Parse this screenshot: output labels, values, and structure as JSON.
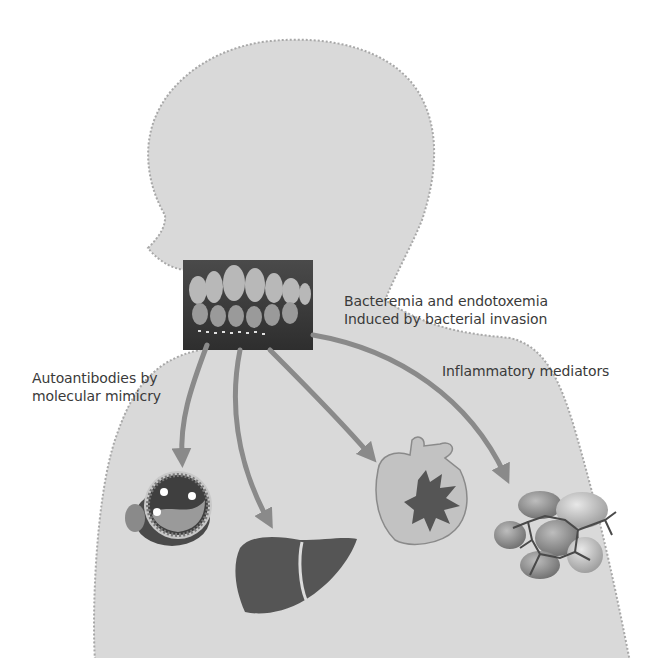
{
  "figure": {
    "labels": {
      "bacteremia": {
        "line1": "Bacteremia and endotoxemia",
        "line2": "Induced by bacterial invasion"
      },
      "autoantibodies": {
        "line1": "Autoantibodies by",
        "line2": "molecular mimicry"
      },
      "inflammatory": {
        "line1": "Inflammatory mediators"
      }
    },
    "source": {
      "name": "oral-cavity-photo",
      "description": "Photo of inflamed gums and teeth"
    },
    "targets": [
      {
        "name": "blood-vessel",
        "description": "Atherosclerotic artery cross-section"
      },
      {
        "name": "liver",
        "description": "Liver"
      },
      {
        "name": "heart",
        "description": "Heart with infarct/damage burst"
      },
      {
        "name": "adipose-tissue",
        "description": "Fat cells"
      }
    ],
    "colors": {
      "silhouette": "#d9d9d9",
      "silhouette_border": "#a8a8a8",
      "arrow": "#8a8a8a",
      "text": "#3a3a3a",
      "organ_dark": "#5a5a5a"
    }
  }
}
